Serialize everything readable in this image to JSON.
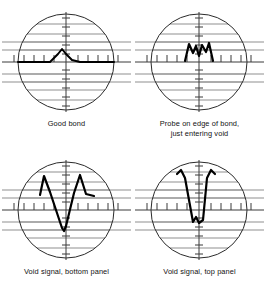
{
  "figure": {
    "colors": {
      "background": "#ffffff",
      "graticule_line": "#8f8f8f",
      "axis_line": "#3a3a3a",
      "circle_outline": "#2b2b2b",
      "trace": "#000000",
      "caption_text": "#111111"
    },
    "panels": [
      {
        "id": "good-bond",
        "caption_lines": [
          "Good bond"
        ],
        "waveform_name": "small-centered-peak",
        "description": "Single small triangular peak centered on the vertical axis, resting on the horizontal baseline",
        "trace_points": "18,62 36,62 50,62 58,54 62,49 66,54 72,60 80,62 96,62 114,62"
      },
      {
        "id": "probe-edge-of-bond",
        "caption_lines": [
          "Probe on edge of bond,",
          "just entering void"
        ],
        "waveform_name": "double-peak-m-shape",
        "description": "M-shaped double peak just above the baseline, straddling the vertical axis",
        "trace_points": "52,61 56,44 60,53 63,46 66,56 69,45 73,52 76,43 80,61"
      },
      {
        "id": "void-signal-bottom-panel",
        "caption_lines": [
          "Void signal, bottom panel"
        ],
        "waveform_name": "deep-v-between-two-peaks",
        "description": "Two peaks above the baseline with a deep V excursion dropping well below the baseline at the center",
        "trace_points": "40,47 44,28 50,44 62,80 64,83 66,78 74,45 80,27 86,46 94,48"
      },
      {
        "id": "void-signal-top-panel",
        "caption_lines": [
          "Void signal, top panel"
        ],
        "waveform_name": "twin-tall-peaks-with-notch",
        "description": "Two tall narrow hooked peaks descending steeply into a small notch near the lower baseline",
        "trace_points": "44,26 48,22 52,30 60,74 63,69 66,75 70,72 74,30 78,22 82,26"
      }
    ],
    "graticule": {
      "circle_radius": 48,
      "horizontal_line_offsets": [
        -38,
        -28,
        -20,
        -12,
        0,
        12,
        20,
        28,
        38
      ],
      "vertical_axis": true,
      "horizontal_axis_ticks": 19,
      "vertical_axis_ticks": 17,
      "tick_spacing_px": 9.6
    }
  }
}
